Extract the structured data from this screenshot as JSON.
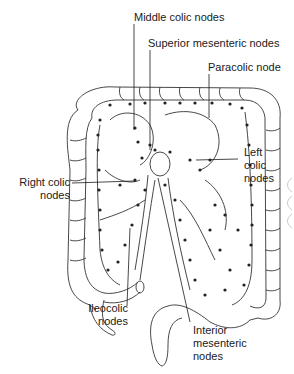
{
  "figure": {
    "labels": [
      {
        "id": "middle-colic",
        "text": "Middle colic nodes"
      },
      {
        "id": "superior-mesenteric",
        "text": "Superior mesenteric nodes"
      },
      {
        "id": "paracolic",
        "text": "Paracolic node"
      },
      {
        "id": "left-colic",
        "line1": "Left",
        "line2": "colic",
        "line3": "nodes"
      },
      {
        "id": "right-colic",
        "line1": "Right colic",
        "line2": "nodes"
      },
      {
        "id": "ileocolic",
        "line1": "Ileocolic",
        "line2": "nodes"
      },
      {
        "id": "inferior-mesenteric",
        "line1": "Interior",
        "line2": "mesenteric",
        "line3": "nodes"
      }
    ]
  },
  "colors": {
    "ink": "#1a1a1a",
    "node": "#222222",
    "background": "#ffffff"
  }
}
